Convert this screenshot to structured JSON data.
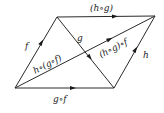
{
  "diagram": {
    "type": "commutative-diagram",
    "stroke_color": "#2a2a2a",
    "nodes": [
      {
        "id": "A",
        "x": 15,
        "y": 88
      },
      {
        "id": "B",
        "x": 57,
        "y": 17
      },
      {
        "id": "C",
        "x": 114,
        "y": 88
      },
      {
        "id": "D",
        "x": 155,
        "y": 16
      }
    ],
    "edges": [
      {
        "from": "A",
        "to": "B",
        "label": "f"
      },
      {
        "from": "B",
        "to": "C",
        "label": "g"
      },
      {
        "from": "C",
        "to": "D",
        "label": "h"
      },
      {
        "from": "A",
        "to": "C",
        "label": "g∘f"
      },
      {
        "from": "B",
        "to": "D",
        "label": "(h∘g)"
      },
      {
        "from": "A",
        "to": "D",
        "label_lower": "h∘(g∘f)",
        "label_upper": "(h∘g)∘f"
      }
    ],
    "labels": {
      "f": "f",
      "g": "g",
      "h": "h",
      "gf": "g∘f",
      "hg": "(h∘g)",
      "h_gf": "h∘(g∘f)",
      "hg_f": "(h∘g)∘f"
    }
  }
}
